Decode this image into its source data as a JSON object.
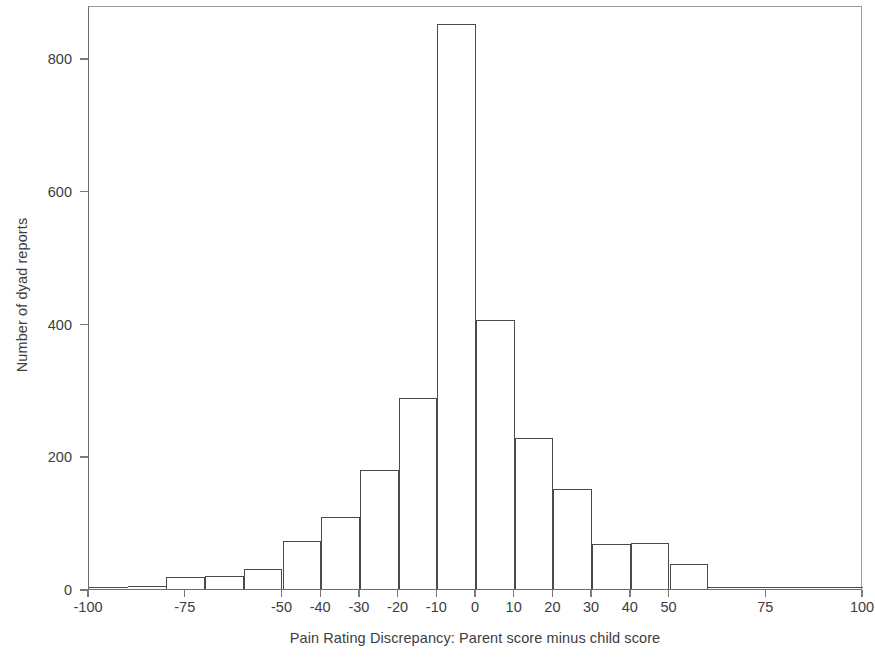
{
  "chart_data": {
    "type": "bar",
    "title": "",
    "subtitle": "",
    "xlabel": "Pain Rating Discrepancy: Parent score minus child score",
    "ylabel": "Number of dyad reports",
    "xlim": [
      -100,
      100
    ],
    "ylim": [
      0,
      880
    ],
    "grid": false,
    "legend": null,
    "bin_width": 10,
    "x_tick_labels": [
      "-100",
      "-75",
      "-50",
      "-40",
      "-30",
      "-20",
      "-10",
      "0",
      "10",
      "20",
      "30",
      "40",
      "50",
      "75",
      "100"
    ],
    "x_tick_values": [
      -100,
      -75,
      -50,
      -40,
      -30,
      -20,
      -10,
      0,
      10,
      20,
      30,
      40,
      50,
      75,
      100
    ],
    "y_tick_labels": [
      "0",
      "200",
      "400",
      "600",
      "800"
    ],
    "y_tick_values": [
      0,
      200,
      400,
      600,
      800
    ],
    "categories": [
      -95,
      -85,
      -75,
      -65,
      -55,
      -45,
      -35,
      -25,
      -15,
      -5,
      5,
      15,
      25,
      35,
      45,
      55,
      65,
      75,
      85,
      95
    ],
    "values": [
      2,
      4,
      18,
      19,
      30,
      73,
      109,
      179,
      288,
      851,
      405,
      227,
      151,
      68,
      69,
      38,
      2,
      1,
      1,
      1
    ],
    "bars": [
      {
        "center": -95,
        "low": -100,
        "high": -90,
        "value": 2
      },
      {
        "center": -85,
        "low": -90,
        "high": -80,
        "value": 4
      },
      {
        "center": -75,
        "low": -80,
        "high": -70,
        "value": 18
      },
      {
        "center": -65,
        "low": -70,
        "high": -60,
        "value": 19
      },
      {
        "center": -55,
        "low": -60,
        "high": -50,
        "value": 30
      },
      {
        "center": -45,
        "low": -50,
        "high": -40,
        "value": 73
      },
      {
        "center": -35,
        "low": -40,
        "high": -30,
        "value": 109
      },
      {
        "center": -25,
        "low": -30,
        "high": -20,
        "value": 179
      },
      {
        "center": -15,
        "low": -20,
        "high": -10,
        "value": 288
      },
      {
        "center": -5,
        "low": -10,
        "high": 0,
        "value": 851
      },
      {
        "center": 5,
        "low": 0,
        "high": 10,
        "value": 405
      },
      {
        "center": 15,
        "low": 10,
        "high": 20,
        "value": 227
      },
      {
        "center": 25,
        "low": 20,
        "high": 30,
        "value": 151
      },
      {
        "center": 35,
        "low": 30,
        "high": 40,
        "value": 68
      },
      {
        "center": 45,
        "low": 40,
        "high": 50,
        "value": 69
      },
      {
        "center": 55,
        "low": 50,
        "high": 60,
        "value": 38
      },
      {
        "center": 65,
        "low": 60,
        "high": 70,
        "value": 2
      },
      {
        "center": 75,
        "low": 70,
        "high": 80,
        "value": 1
      },
      {
        "center": 85,
        "low": 80,
        "high": 90,
        "value": 1
      },
      {
        "center": 95,
        "low": 90,
        "high": 100,
        "value": 1
      }
    ],
    "bar_style": {
      "fill": "#ffffff",
      "stroke": "#4a4a4a",
      "axis_color": "#6b6b6b",
      "text_color": "#3d3d3d"
    }
  }
}
